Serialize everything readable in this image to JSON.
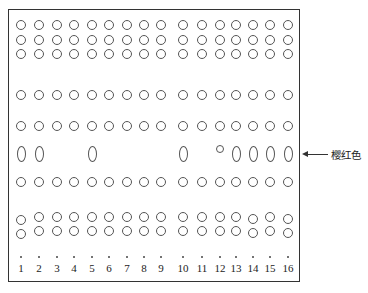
{
  "figure": {
    "type": "gel-electrophoresis-schematic",
    "lane_count": 16,
    "lane_labels": [
      "1",
      "2",
      "3",
      "4",
      "5",
      "6",
      "7",
      "8",
      "9",
      "10",
      "11",
      "12",
      "13",
      "14",
      "15",
      "16"
    ],
    "annotation": {
      "label": "樱红色",
      "points_to_row": 6
    },
    "rows": [
      {
        "row": 1,
        "shape": "circle",
        "lanes": [
          1,
          2,
          3,
          4,
          5,
          6,
          7,
          8,
          9,
          10,
          11,
          12,
          13,
          14,
          15,
          16
        ]
      },
      {
        "row": 2,
        "shape": "circle",
        "lanes": [
          1,
          2,
          3,
          4,
          5,
          6,
          7,
          8,
          9,
          10,
          11,
          12,
          13,
          14,
          15,
          16
        ]
      },
      {
        "row": 3,
        "shape": "circle",
        "lanes": [
          1,
          2,
          3,
          4,
          5,
          6,
          7,
          8,
          9,
          10,
          11,
          12,
          13,
          14,
          15,
          16
        ]
      },
      {
        "row": 4,
        "shape": "circle",
        "lanes": [
          1,
          2,
          3,
          4,
          5,
          6,
          7,
          8,
          9,
          10,
          11,
          12,
          13,
          14,
          15,
          16
        ]
      },
      {
        "row": 5,
        "shape": "circle",
        "lanes": [
          1,
          2,
          3,
          4,
          5,
          6,
          7,
          8,
          9,
          10,
          11,
          12,
          13,
          14,
          15,
          16
        ]
      },
      {
        "row": 6,
        "shape": "oval",
        "lanes": [
          1,
          2,
          5,
          10,
          13,
          14,
          15,
          16
        ],
        "small_circle_lanes": [
          12
        ]
      },
      {
        "row": 7,
        "shape": "circle",
        "lanes": [
          1,
          2,
          3,
          4,
          5,
          6,
          7,
          8,
          9,
          10,
          11,
          12,
          13,
          14,
          15,
          16
        ]
      },
      {
        "row": 8,
        "shape": "circle",
        "lanes": [
          1,
          2,
          3,
          4,
          5,
          6,
          7,
          8,
          9,
          10,
          11,
          12,
          13,
          14,
          15,
          16
        ]
      },
      {
        "row": 9,
        "shape": "circle",
        "lanes": [
          1,
          2,
          3,
          4,
          5,
          6,
          7,
          8,
          9,
          10,
          11,
          12,
          13,
          14,
          15,
          16
        ]
      }
    ],
    "origin_dots": "one per lane"
  }
}
